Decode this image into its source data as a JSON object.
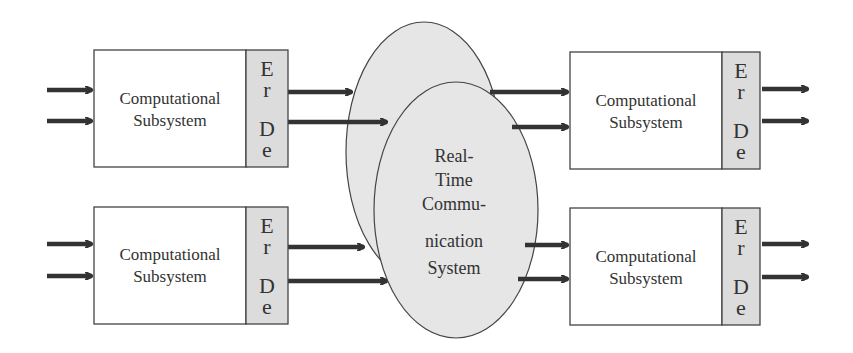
{
  "diagram": {
    "colors": {
      "stroke": "#333333",
      "box_fill": "#ffffff",
      "strip_fill": "#dcdcdc",
      "ellipse_fill": "#e6e6e6",
      "text": "#333333"
    },
    "subsystems": [
      {
        "id": "top-left",
        "line1": "Computational",
        "line2": "Subsystem",
        "strip": [
          "E",
          "r",
          "D",
          "e"
        ]
      },
      {
        "id": "bottom-left",
        "line1": "Computational",
        "line2": "Subsystem",
        "strip": [
          "E",
          "r",
          "D",
          "e"
        ]
      },
      {
        "id": "top-right",
        "line1": "Computational",
        "line2": "Subsystem",
        "strip": [
          "E",
          "r",
          "D",
          "e"
        ]
      },
      {
        "id": "bottom-right",
        "line1": "Computational",
        "line2": "Subsystem",
        "strip": [
          "E",
          "r",
          "D",
          "e"
        ]
      }
    ],
    "communication_system": {
      "lines": [
        "Real-",
        "Time",
        "Commu-",
        "nication",
        "System"
      ]
    },
    "arrows": {
      "inputs_per_box": 2,
      "outputs_per_box": 2
    }
  }
}
